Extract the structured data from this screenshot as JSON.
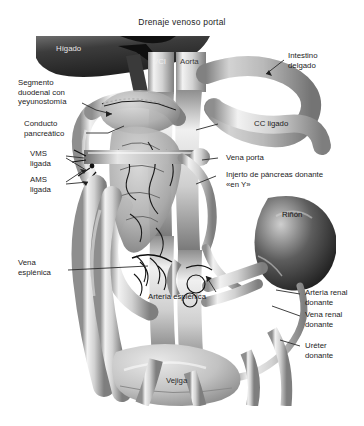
{
  "figure": {
    "title": "Drenaje venoso portal",
    "style": "grayscale medical line illustration"
  },
  "labels": {
    "liver": {
      "text": "Hígado",
      "side": "in"
    },
    "ivc": {
      "text": "VCI",
      "side": "in"
    },
    "aorta": {
      "text": "Aorta",
      "side": "in"
    },
    "kidney": {
      "text": "Riñón",
      "side": "in"
    },
    "bladder": {
      "text": "Vejiga",
      "side": "in"
    },
    "duodenal_segment": {
      "text": "Segmento\nduodenal con\nyeyunostomía",
      "side": "left"
    },
    "pancreatic_duct": {
      "text": "Conducto\npancreático",
      "side": "left"
    },
    "vms_ligated": {
      "text": "VMS\nligada",
      "side": "left"
    },
    "ams_ligated": {
      "text": "AMS\nligada",
      "side": "left"
    },
    "splenic_vein": {
      "text": "Vena\nesplénica",
      "side": "left"
    },
    "splenic_artery": {
      "text": "Arteria esplénica",
      "side": "bottom"
    },
    "small_bowel": {
      "text": "Intestino\ndelgado",
      "side": "right"
    },
    "cc_ligated": {
      "text": "CC ligado",
      "side": "right"
    },
    "portal_vein": {
      "text": "Vena porta",
      "side": "right"
    },
    "y_graft": {
      "text": "Injerto de páncreas donante\n«en Y»",
      "side": "right"
    },
    "donor_renal_artery": {
      "text": "Arteria renal\ndonante",
      "side": "right"
    },
    "donor_renal_vein": {
      "text": "Vena renal\ndonante",
      "side": "right"
    },
    "donor_ureter": {
      "text": "Uréter\ndonante",
      "side": "right"
    }
  },
  "colors": {
    "ink": "#1c1c1c",
    "leader": "#2a2a2a",
    "background": "#ffffff",
    "organ_dark": "#3a3a3a",
    "organ_mid": "#9a9a9a",
    "organ_light": "#dcdcdc",
    "vessel_light": "#e8e8e8"
  }
}
